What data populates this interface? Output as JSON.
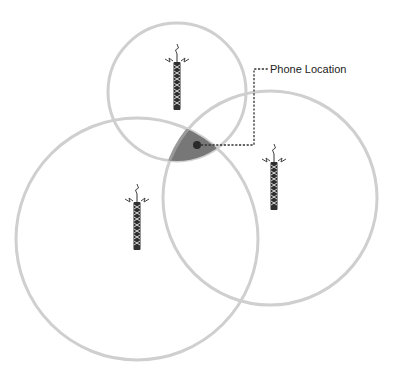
{
  "diagram": {
    "label": "Phone Location",
    "colors": {
      "coverage_ring": "#cfcfcf",
      "intersection_fill": "#777777",
      "intersection_stroke": "#9a9a9a",
      "phone_dot": "#2a2a2a",
      "tower": "#2f2f2f"
    },
    "towers": [
      {
        "id": "top-tower",
        "icon": "cell-tower-icon"
      },
      {
        "id": "left-tower",
        "icon": "cell-tower-icon"
      },
      {
        "id": "right-tower",
        "icon": "cell-tower-icon"
      }
    ],
    "coverage_areas": [
      {
        "id": "top-coverage"
      },
      {
        "id": "left-coverage"
      },
      {
        "id": "right-coverage"
      }
    ]
  }
}
